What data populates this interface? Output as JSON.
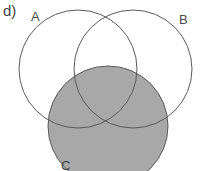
{
  "figure": {
    "part_label": "d)",
    "type": "venn-diagram",
    "width": 200,
    "height": 171,
    "background_color": "#ffffff",
    "stroke_color": "#5a5a5a",
    "shaded_fill_color": "#a8a8a8",
    "sets": [
      {
        "id": "A",
        "label": "A",
        "shaded": false,
        "cx": 78,
        "cy": 69,
        "r": 59
      },
      {
        "id": "B",
        "label": "B",
        "shaded": false,
        "cx": 133,
        "cy": 69,
        "r": 59
      },
      {
        "id": "C",
        "label": "C",
        "shaded": true,
        "cx": 108,
        "cy": 126,
        "r": 60
      }
    ],
    "shaded_region_description": "C"
  }
}
